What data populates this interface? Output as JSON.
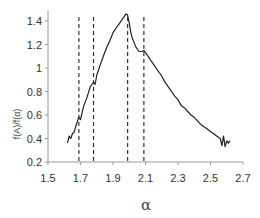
{
  "chart_data": {
    "type": "line",
    "title": "",
    "xlabel": "α",
    "ylabel": "f(Α)/f(α)",
    "xlim": [
      1.5,
      2.7
    ],
    "ylim": [
      0.2,
      1.5
    ],
    "xticks": [
      1.5,
      1.7,
      1.9,
      2.1,
      2.3,
      2.5,
      2.7
    ],
    "xtick_labels": [
      "1.5",
      "1.7",
      "1.9",
      "2.1",
      "2.3",
      "2.5",
      "2.7"
    ],
    "yticks": [
      0.2,
      0.4,
      0.6,
      0.8,
      1.0,
      1.2,
      1.4
    ],
    "ytick_labels": [
      "0.2",
      "0.4",
      "0.6",
      "0.8",
      "1",
      "1.2",
      "1.4"
    ],
    "grid": false,
    "legend": null,
    "vertical_dashed_lines": [
      1.69,
      1.78,
      1.99,
      2.09
    ],
    "series": [
      {
        "name": "f(α) spectrum",
        "color": "#222222",
        "x": [
          1.62,
          1.63,
          1.64,
          1.65,
          1.66,
          1.67,
          1.68,
          1.69,
          1.7,
          1.71,
          1.72,
          1.74,
          1.76,
          1.77,
          1.78,
          1.79,
          1.8,
          1.82,
          1.84,
          1.86,
          1.88,
          1.9,
          1.92,
          1.94,
          1.96,
          1.97,
          1.98,
          1.99,
          2.0,
          2.01,
          2.02,
          2.04,
          2.06,
          2.08,
          2.09,
          2.1,
          2.12,
          2.14,
          2.16,
          2.18,
          2.2,
          2.22,
          2.24,
          2.26,
          2.28,
          2.3,
          2.32,
          2.34,
          2.36,
          2.38,
          2.4,
          2.42,
          2.44,
          2.46,
          2.48,
          2.5,
          2.52,
          2.54,
          2.56,
          2.57,
          2.58,
          2.59,
          2.6,
          2.61,
          2.62
        ],
        "values": [
          0.36,
          0.42,
          0.4,
          0.44,
          0.45,
          0.5,
          0.54,
          0.58,
          0.56,
          0.62,
          0.68,
          0.75,
          0.84,
          0.86,
          0.88,
          0.86,
          0.94,
          1.02,
          1.1,
          1.17,
          1.23,
          1.3,
          1.34,
          1.38,
          1.42,
          1.44,
          1.46,
          1.45,
          1.38,
          1.3,
          1.25,
          1.18,
          1.14,
          1.14,
          1.15,
          1.13,
          1.09,
          1.05,
          1.01,
          0.97,
          0.93,
          0.88,
          0.84,
          0.8,
          0.76,
          0.73,
          0.68,
          0.66,
          0.63,
          0.6,
          0.58,
          0.55,
          0.52,
          0.5,
          0.48,
          0.46,
          0.44,
          0.42,
          0.4,
          0.34,
          0.42,
          0.33,
          0.38,
          0.36,
          0.38
        ]
      }
    ]
  }
}
